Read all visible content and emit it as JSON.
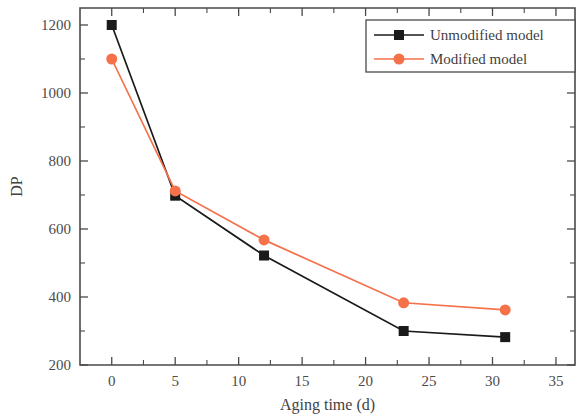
{
  "chart_data": {
    "type": "line",
    "title": "",
    "xlabel": "Aging time (d)",
    "ylabel": "DP",
    "xlim": [
      -2.5,
      36.5
    ],
    "ylim": [
      200,
      1250
    ],
    "xticks": [
      0,
      5,
      10,
      15,
      20,
      25,
      30,
      35
    ],
    "xtick_labels": [
      "0",
      "5",
      "10",
      "15",
      "20",
      "25",
      "30",
      "35"
    ],
    "yticks": [
      200,
      400,
      600,
      800,
      1000,
      1200
    ],
    "ytick_labels": [
      "200",
      "400",
      "600",
      "800",
      "1000",
      "1200"
    ],
    "x_minor_ticks": [
      2.5,
      7.5,
      12.5,
      17.5,
      22.5,
      27.5,
      32.5
    ],
    "y_minor_ticks": [
      300,
      500,
      700,
      900,
      1100
    ],
    "grid": false,
    "legend_position": "top-right",
    "series": [
      {
        "name": "Unmodified model",
        "marker": "square",
        "color": "#1a1a1a",
        "x": [
          0,
          5,
          12,
          23,
          31
        ],
        "values": [
          1200,
          698,
          522,
          300,
          282
        ]
      },
      {
        "name": "Modified model",
        "marker": "circle",
        "color": "#F4714A",
        "x": [
          0,
          5,
          12,
          23,
          31
        ],
        "values": [
          1100,
          712,
          568,
          383,
          362
        ]
      }
    ]
  },
  "legend": {
    "entries": [
      {
        "label": "Unmodified model",
        "color": "#1a1a1a",
        "marker": "square"
      },
      {
        "label": "Modified model",
        "color": "#F4714A",
        "marker": "circle"
      }
    ]
  },
  "colors": {
    "series_unmodified": "#1a1a1a",
    "series_modified": "#F4714A",
    "axis": "#4a4a4a",
    "text": "#3f3f3f",
    "background": "#ffffff"
  }
}
